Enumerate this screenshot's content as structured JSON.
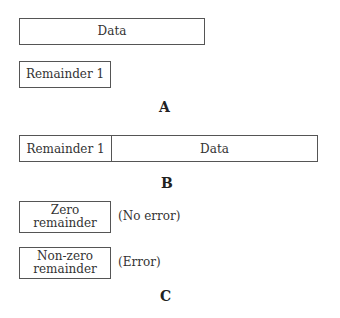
{
  "panel_a": {
    "label": "A",
    "data_box": "Data",
    "remainder_box": "Remainder 1"
  },
  "panel_b": {
    "label": "B",
    "cells": [
      "Remainder 1",
      "Data"
    ]
  },
  "panel_c": {
    "label": "C",
    "rows": [
      {
        "box_line1": "Zero",
        "box_line2": "remainder",
        "note": "(No error)"
      },
      {
        "box_line1": "Non-zero",
        "box_line2": "remainder",
        "note": "(Error)"
      }
    ]
  }
}
